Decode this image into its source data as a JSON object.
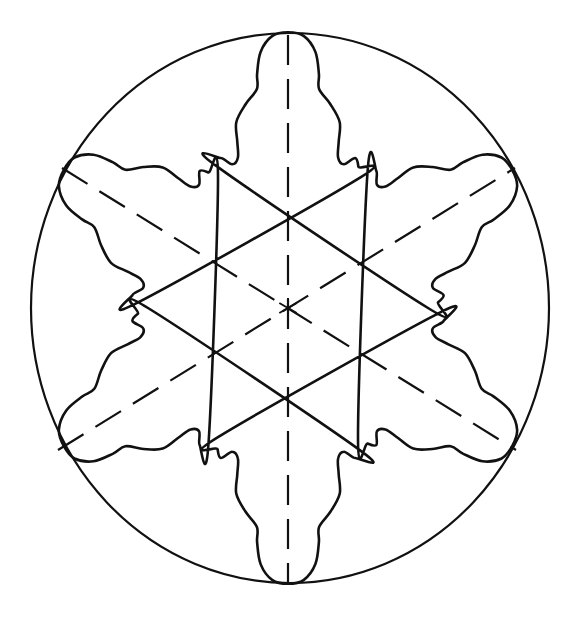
{
  "figure": {
    "title": "",
    "stroke_color": "#111111",
    "background": "#ffffff"
  },
  "geometry": {
    "center": [
      288,
      308
    ],
    "boundary_circle": {
      "cx": 290,
      "cy": 308,
      "rx": 259,
      "ry": 275
    },
    "y_stretch": 1.065,
    "lobe_count": 6,
    "lobe_axes_deg": [
      90,
      30,
      -30,
      -90,
      -150,
      150
    ],
    "lobe_profile_half": [
      [
        0,
        259
      ],
      [
        3.5,
        256
      ],
      [
        6.5,
        242
      ],
      [
        8.0,
        222
      ],
      [
        8.6,
        208
      ],
      [
        12.5,
        196
      ],
      [
        16.5,
        182
      ],
      [
        18.0,
        164
      ],
      [
        19.5,
        150
      ],
      [
        22.5,
        146
      ],
      [
        25.5,
        156
      ],
      [
        28.0,
        150
      ],
      [
        30.0,
        140
      ]
    ],
    "dashed_diameters": [
      {
        "name": "vertical-axis",
        "from": [
          288,
          35
        ],
        "to": [
          288,
          583
        ]
      },
      {
        "name": "diagonal-axis-a",
        "from": [
          62,
          168
        ],
        "to": [
          516,
          450
        ]
      },
      {
        "name": "diagonal-axis-b",
        "from": [
          58,
          450
        ],
        "to": [
          515,
          168
        ]
      }
    ],
    "center_mark_size": 10
  }
}
